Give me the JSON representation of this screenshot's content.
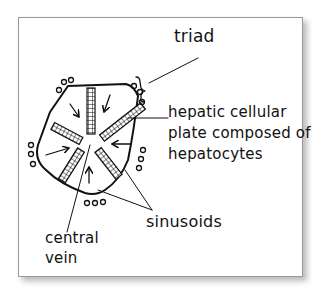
{
  "diagram": {
    "type": "liver-lobule-sketch",
    "labels": {
      "triad": "triad",
      "plate_line1": "hepatic cellular",
      "plate_line2": "plate composed of",
      "plate_line3": "hepatocytes",
      "sinusoids": "sinusoids",
      "central_vein_line1": "central",
      "central_vein_line2": "vein"
    },
    "structures": [
      "lobule-outline",
      "hepatic-plates",
      "flow-arrows",
      "portal-triads",
      "central-vein"
    ],
    "colors": {
      "ink": "#111111",
      "frame": "#9a9a9a",
      "background": "#ffffff"
    }
  }
}
